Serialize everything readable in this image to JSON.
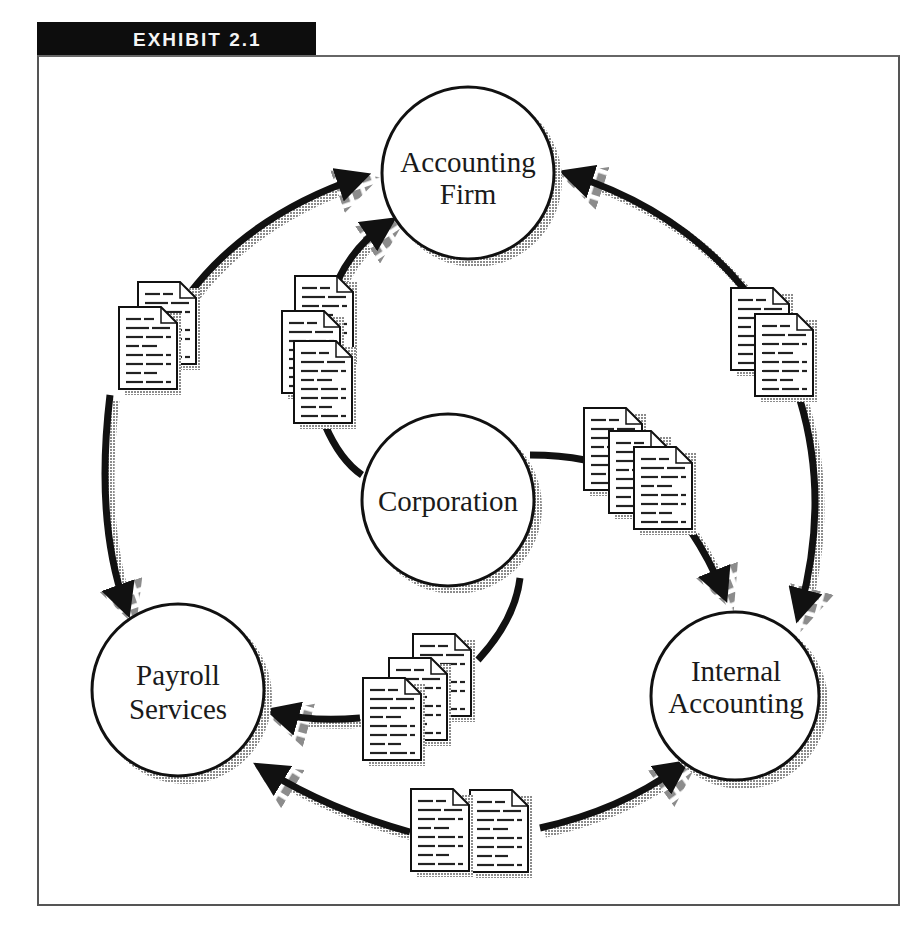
{
  "exhibit": {
    "label": "EXHIBIT 2.1"
  },
  "colors": {
    "ink": "#111111",
    "shadow": "#9a9a9a",
    "paper": "#ffffff",
    "frame": "#555555"
  },
  "nodes": {
    "accounting_firm": {
      "line1": "Accounting",
      "line2": "Firm"
    },
    "corporation": {
      "line1": "Corporation"
    },
    "payroll_services": {
      "line1": "Payroll",
      "line2": "Services"
    },
    "internal_accounting": {
      "line1": "Internal",
      "line2": "Accounting"
    }
  },
  "edges": [
    {
      "from": "Payroll Services",
      "to": "Accounting Firm",
      "documents": 2
    },
    {
      "from": "Corporation",
      "to": "Accounting Firm",
      "documents": 3
    },
    {
      "from": "Internal Accounting",
      "to": "Accounting Firm",
      "documents": 2
    },
    {
      "from": "Accounting Firm",
      "to": "Internal Accounting",
      "documents": 2
    },
    {
      "from": "Corporation",
      "to": "Internal Accounting",
      "documents": 3
    },
    {
      "from": "Corporation",
      "to": "Payroll Services",
      "documents": 3
    },
    {
      "from": "Accounting Firm",
      "to": "Payroll Services",
      "documents": 2
    },
    {
      "from": "Internal Accounting",
      "to": "Payroll Services",
      "documents": 2
    },
    {
      "from": "Payroll Services",
      "to": "Internal Accounting",
      "documents": 2
    }
  ]
}
